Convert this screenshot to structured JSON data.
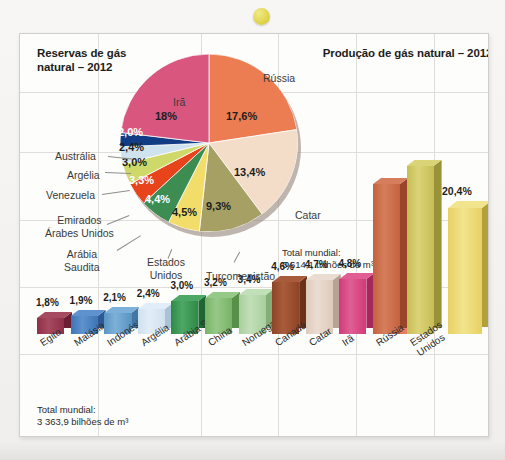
{
  "decor": {
    "dot": "yellow-dot"
  },
  "titles": {
    "left": "Reservas de gás natural – 2012",
    "right": "Produção de gás natural – 2012"
  },
  "totals": {
    "pie": "Total mundial:\n6 614,1 trilhões de m³",
    "bars": "Total mundial:\n3 363,9 bilhões de m³"
  },
  "chart_data": [
    {
      "type": "pie",
      "title": "Reservas de gás natural – 2012",
      "note": "Total mundial: 6 614,1 trilhões de m³",
      "unit": "%",
      "labels": [
        "Irã",
        "Rússia",
        "Catar",
        "Turcomenistão",
        "Estados Unidos",
        "Arábia Saudita",
        "Emirados Árabes Unidos",
        "Venezuela",
        "Argélia",
        "Austrália",
        "Outros"
      ],
      "values": [
        18.0,
        17.6,
        13.4,
        9.3,
        4.5,
        4.4,
        3.3,
        3.0,
        2.4,
        2.0,
        22.1
      ],
      "value_labels": [
        "18%",
        "17,6%",
        "13,4%",
        "9,3%",
        "4,5%",
        "4,4%",
        "3,3%",
        "3,0%",
        "2,4%",
        "2,0%",
        ""
      ],
      "colors": [
        "#d9567f",
        "#ec7d52",
        "#f3ddc9",
        "#a7a065",
        "#f2dd6b",
        "#3d8c52",
        "#e8441c",
        "#cfd96a",
        "#cfe3ef",
        "#123c83",
        "#ffffff"
      ],
      "legend": "labels-with-leaders"
    },
    {
      "type": "bar",
      "title": "Produção de gás natural – 2012",
      "unit": "%",
      "categories": [
        "Rússia",
        "Estados Unidos"
      ],
      "values": [
        17.6,
        20.4
      ],
      "value_labels": [
        "17,6%",
        "20,4%"
      ],
      "colors": [
        "#de7055",
        "#e8d063"
      ],
      "ylim": [
        0,
        22
      ]
    },
    {
      "type": "bar",
      "title": "Reservas de gás natural – maiores detentores",
      "note": "Total mundial: 3 363,9 bilhões de m³",
      "unit": "%",
      "categories": [
        "Egito",
        "Malásia",
        "Indonésia",
        "Argélia",
        "Arábia Saudita",
        "China",
        "Noruega",
        "Canadá",
        "Catar",
        "Irã",
        "Rússia",
        "Estados Unidos"
      ],
      "values": [
        1.8,
        1.9,
        2.1,
        2.4,
        3.0,
        3.2,
        3.4,
        4.6,
        4.7,
        4.8,
        17.6,
        20.4
      ],
      "value_labels": [
        "1,8%",
        "1,9%",
        "2,1%",
        "2,4%",
        "3,0%",
        "3,2%",
        "3,4%",
        "4,6%",
        "4,7%",
        "4,8%",
        "",
        ""
      ],
      "colors": [
        "#8e2f47",
        "#3f74b5",
        "#5a95c4",
        "#cfe0ee",
        "#2f8a46",
        "#77b366",
        "#a9cf9e",
        "#8e4526",
        "#ddcbbd",
        "#d23a77",
        "#c4623f",
        "#c6bd55"
      ],
      "ylim": [
        0,
        22
      ]
    }
  ],
  "pie_slices": [
    {
      "name": "Rússia",
      "value_label": "17,6%",
      "color": "#ec7d52",
      "label_color": "dark",
      "lx": 106,
      "ly": 56
    },
    {
      "name": "Catar",
      "value_label": "13,4%",
      "color": "#f3ddc9",
      "label_color": "dark",
      "lx": 114,
      "ly": 112
    },
    {
      "name": "Turcomenistão",
      "value_label": "9,3%",
      "color": "#a7a065",
      "label_color": "dark",
      "lx": 86,
      "ly": 146
    },
    {
      "name": "Estados Unidos",
      "value_label": "4,5%",
      "color": "#f2dd6b",
      "label_color": "dark",
      "lx": 52,
      "ly": 152
    },
    {
      "name": "Arábia Saudita",
      "value_label": "4,4%",
      "color": "#3d8c52",
      "label_color": "white",
      "lx": 25,
      "ly": 139
    },
    {
      "name": "Emirados Árabes Unidos",
      "value_label": "3,3%",
      "color": "#e8441c",
      "label_color": "white",
      "lx": 9,
      "ly": 120
    },
    {
      "name": "Venezuela",
      "value_label": "3,0%",
      "color": "#cfd96a",
      "label_color": "dark",
      "lx": 2,
      "ly": 102
    },
    {
      "name": "Argélia",
      "value_label": "2,4%",
      "color": "#cfe3ef",
      "label_color": "dark",
      "lx": -1,
      "ly": 87
    },
    {
      "name": "Austrália",
      "value_label": "2,0%",
      "color": "#123c83",
      "label_color": "white",
      "lx": -2,
      "ly": 72
    },
    {
      "name": "Irã",
      "value_label": "18%",
      "color": "#d9567f",
      "label_color": "dark",
      "lx": 35,
      "ly": 56
    }
  ],
  "pie_names": [
    {
      "label": "Rússia",
      "x": 243,
      "y": 38
    },
    {
      "label": "Catar",
      "x": 275,
      "y": 175
    },
    {
      "label": "Turcomenistão",
      "x": 186,
      "y": 236
    },
    {
      "label": "Estados\nUnidos",
      "x": 127,
      "y": 222
    },
    {
      "label": "Arábia\nSaudita",
      "x": 44,
      "y": 214
    },
    {
      "label": "Emirados\nÁrabes Unidos",
      "x": 25,
      "y": 180
    },
    {
      "label": "Venezuela",
      "x": 26,
      "y": 155
    },
    {
      "label": "Argélia",
      "x": 47,
      "y": 135
    },
    {
      "label": "Austrália",
      "x": 35,
      "y": 116
    },
    {
      "label": "Irã",
      "x": 153,
      "y": 62
    }
  ],
  "prod_bars": [
    {
      "name": "Rússia",
      "value_label": "17,6%",
      "color": "#de7055",
      "side": "#b0432a",
      "top": "#ef8f72",
      "x": 378,
      "w": 34,
      "h": 108
    },
    {
      "name": "Estados Unidos",
      "value_label": "20,4%",
      "color": "#e8d063",
      "side": "#b2a03c",
      "top": "#f2e48d",
      "x": 428,
      "w": 34,
      "h": 126
    }
  ],
  "bars": [
    {
      "name": "Egito",
      "value_label": "1,8%",
      "color": "#8e2f47",
      "side": "#6a1f32",
      "top": "#a64a60",
      "h": 16
    },
    {
      "name": "Malásia",
      "value_label": "1,9%",
      "color": "#3f74b5",
      "side": "#2d5a92",
      "top": "#5d92ce",
      "h": 18
    },
    {
      "name": "Indonésia",
      "value_label": "2,1%",
      "color": "#5a95c4",
      "side": "#4077a4",
      "top": "#7db0d8",
      "h": 21
    },
    {
      "name": "Argélia",
      "value_label": "2,4%",
      "color": "#cfe0ee",
      "side": "#a9c2d6",
      "top": "#e2eef7",
      "h": 25
    },
    {
      "name": "Arábia Saudita",
      "value_label": "3,0%",
      "color": "#2f8a46",
      "side": "#206633",
      "top": "#4da765",
      "h": 33
    },
    {
      "name": "China",
      "value_label": "3,2%",
      "color": "#77b366",
      "side": "#58904a",
      "top": "#96c988",
      "h": 36
    },
    {
      "name": "Noruega",
      "value_label": "3,4%",
      "color": "#a9cf9e",
      "side": "#85ad7a",
      "top": "#c1dfb8",
      "h": 39
    },
    {
      "name": "Canadá",
      "value_label": "4,6%",
      "color": "#8e4526",
      "side": "#6c3119",
      "top": "#a95c3b",
      "h": 52
    },
    {
      "name": "Catar",
      "value_label": "4,7%",
      "color": "#ddcbbd",
      "side": "#b9a396",
      "top": "#ebdcd1",
      "h": 54
    },
    {
      "name": "Irã",
      "value_label": "4,8%",
      "color": "#d23a77",
      "side": "#a5275b",
      "top": "#e05e93",
      "h": 55
    },
    {
      "name": "Rússia",
      "value_label": "",
      "color": "#c4623f",
      "side": "#99452a",
      "top": "#d67e5c",
      "h": 150
    },
    {
      "name": "Estados\nUnidos",
      "value_label": "",
      "color": "#c6bd55",
      "side": "#9a9239",
      "top": "#dbd378",
      "h": 168
    }
  ],
  "grid": {
    "verticals": [
      78,
      181,
      258,
      336,
      414
    ],
    "horizontals": [
      58,
      118,
      186,
      253,
      320
    ]
  }
}
